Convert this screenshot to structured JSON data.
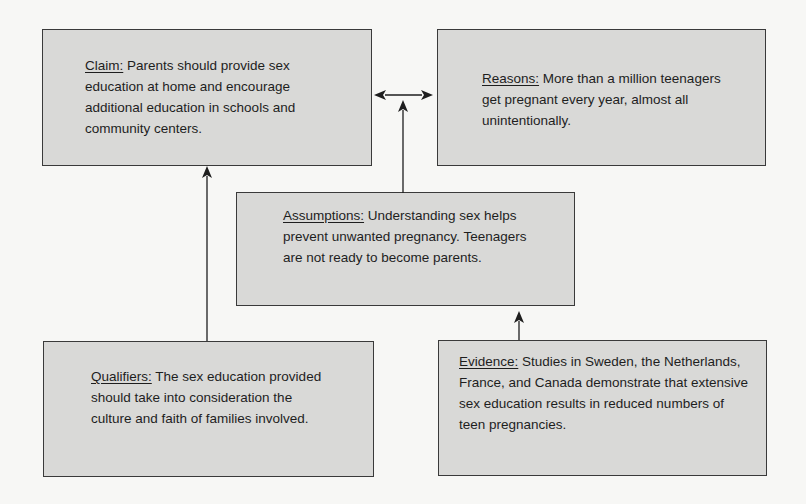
{
  "diagram": {
    "type": "Toulmin argument model",
    "colors": {
      "background": "#f7f7f5",
      "box_fill": "#d9d9d7",
      "box_border": "#3a3a3a",
      "text": "#1e1e1e",
      "arrow": "#1e1e1e"
    },
    "boxes": {
      "claim": {
        "label": "Claim:",
        "text": " Parents should provide sex education at home and encourage additional education in schools and community centers."
      },
      "reasons": {
        "label": "Reasons:",
        "text": " More than a million teenagers get pregnant every year, almost all unintentionally."
      },
      "assumptions": {
        "label": "Assumptions:",
        "text": " Understanding sex helps prevent unwanted pregnancy. Teenagers are not ready to become parents."
      },
      "qualifiers": {
        "label": "Qualifiers:",
        "text": " The sex education provided should take into consideration the culture and faith of families involved."
      },
      "evidence": {
        "label": "Evidence:",
        "text": " Studies in Sweden, the Netherlands, France, and Canada demonstrate that extensive sex education results in reduced numbers of teen pregnancies."
      }
    },
    "edges": [
      {
        "from": "claim",
        "to": "reasons",
        "style": "double-headed arrow"
      },
      {
        "from": "assumptions",
        "to": "claim-reasons link",
        "style": "arrow"
      },
      {
        "from": "qualifiers",
        "to": "claim",
        "style": "arrow"
      },
      {
        "from": "evidence",
        "to": "assumptions",
        "style": "arrow"
      }
    ]
  }
}
